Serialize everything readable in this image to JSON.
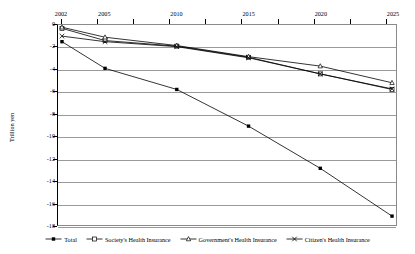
{
  "chart_data": {
    "type": "line",
    "title": "",
    "subtitle": "",
    "xlabel": "",
    "ylabel": "Trillion yen",
    "x_axis_position": "top",
    "grid": true,
    "legend_position": "bottom",
    "categories": [
      "2002",
      "2005",
      "2010",
      "2015",
      "2020",
      "2025"
    ],
    "x_tick_labels": [
      "2002",
      "2005",
      "2010",
      "2015",
      "2020",
      "2025"
    ],
    "y_tick_labels": [
      "0",
      "-2",
      "-4",
      "-6",
      "-8",
      "-10",
      "-12",
      "-14",
      "-16",
      "-18"
    ],
    "y_ticks": [
      0,
      -2,
      -4,
      -6,
      -8,
      -10,
      -12,
      -14,
      -16,
      -18
    ],
    "ylim": [
      -18,
      0
    ],
    "series": [
      {
        "name": "Total",
        "marker": "filled-square",
        "color": "#000000",
        "values": [
          -1.5,
          -3.9,
          -5.8,
          -9.1,
          -12.9,
          -17.2
        ]
      },
      {
        "name": "Society's Health Insurance",
        "marker": "open-square",
        "color": "#000000",
        "values": [
          -0.3,
          -1.4,
          -1.9,
          -2.9,
          -4.4,
          -5.8
        ]
      },
      {
        "name": "Government's Health Insurance",
        "marker": "open-triangle",
        "color": "#000000",
        "values": [
          -0.2,
          -1.1,
          -1.85,
          -2.85,
          -3.7,
          -5.2
        ]
      },
      {
        "name": "Citizen's Health Insurance",
        "marker": "cross-x",
        "color": "#000000",
        "values": [
          -1.0,
          -1.5,
          -1.95,
          -2.95,
          -4.4,
          -5.75
        ]
      }
    ]
  },
  "axes": {
    "y_title": "Trillion yen"
  },
  "legend": {
    "entries": [
      {
        "label": "Total",
        "marker": "filled-square"
      },
      {
        "label": "Society's Health Insurance",
        "marker": "open-square"
      },
      {
        "label": "Government's Health Insurance",
        "marker": "open-triangle"
      },
      {
        "label": "Citizen's Health Insurance",
        "marker": "cross-x"
      }
    ]
  }
}
